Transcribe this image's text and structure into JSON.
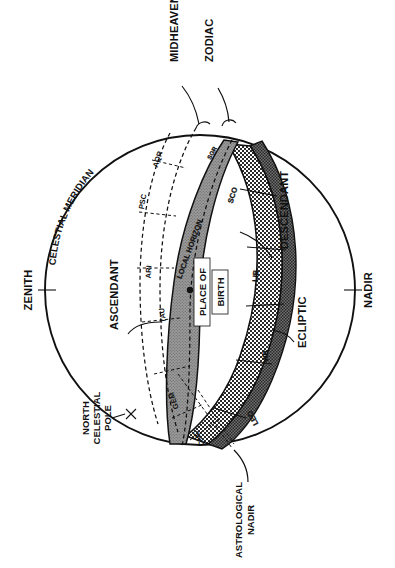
{
  "figure": {
    "orientation": "rotated 90 degrees counter-clockwise",
    "background_color": "#ffffff",
    "ink_color": "#111111",
    "horizon_fill": "#8a8a8a",
    "zodiac_fill": "#d8d8d8"
  },
  "labels": {
    "zenith": "ZENITH",
    "nadir": "NADIR",
    "celestial_meridian": "CELESTIAL MERIDIAN",
    "north_celestial_pole": "NORTH\nCELESTIAL\nPOLE",
    "north_celestial_pole_line1": "NORTH",
    "north_celestial_pole_line2": "CELESTIAL",
    "north_celestial_pole_line3": "POLE",
    "midheaven": "MIDHEAVEN",
    "zodiac": "ZODIAC",
    "descendant": "DESCENDANT",
    "ascendant": "ASCENDANT",
    "ecliptic": "ECLIPTIC",
    "local_horizon": "LOCAL HORIZON",
    "place_of_birth_line1": "PLACE OF",
    "place_of_birth_line2": "BIRTH",
    "astrological_nadir_line1": "ASTROLOGICAL",
    "astrological_nadir_line2": "NADIR"
  },
  "zodiac_signs": [
    {
      "abbr": "AQR",
      "name": "Aquarius",
      "band": "house-dashed"
    },
    {
      "abbr": "PSC",
      "name": "Pisces",
      "band": "house-dashed"
    },
    {
      "abbr": "ARI",
      "name": "Aries",
      "band": "house-dashed"
    },
    {
      "abbr": "TAU",
      "name": "Taurus",
      "band": "house-dashed"
    },
    {
      "abbr": "GEM",
      "name": "Gemini",
      "band": "horizon"
    },
    {
      "abbr": "CNC",
      "name": "Cancer",
      "band": "horizon"
    },
    {
      "abbr": "LEO",
      "name": "Leo",
      "band": "zodiac"
    },
    {
      "abbr": "VIR",
      "name": "Virgo",
      "band": "zodiac"
    },
    {
      "abbr": "LIB",
      "name": "Libra",
      "band": "zodiac"
    },
    {
      "abbr": "SCO",
      "name": "Scorpio",
      "band": "zodiac"
    },
    {
      "abbr": "SGR",
      "name": "Sagittarius",
      "band": "zodiac"
    }
  ],
  "markers": {
    "place_of_birth_dot": "filled-dot",
    "north_celestial_pole_cross": "x-mark",
    "zenith_tick": "tick-mark",
    "nadir_tick": "tick-mark"
  }
}
